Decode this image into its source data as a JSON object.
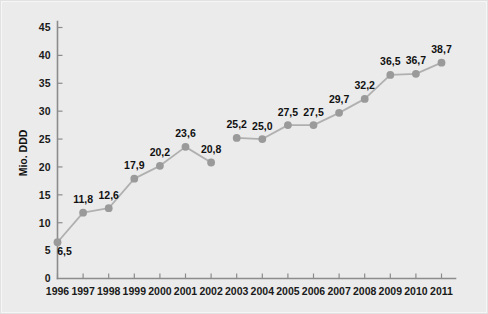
{
  "chart_data": {
    "type": "line",
    "title": "",
    "subtitle": "",
    "xlabel": "",
    "ylabel": "Mio. DDD",
    "categories": [
      "1996",
      "1997",
      "1998",
      "1999",
      "2000",
      "2001",
      "2002",
      "2003",
      "2004",
      "2005",
      "2006",
      "2007",
      "2008",
      "2009",
      "2010",
      "2011"
    ],
    "values": [
      6.5,
      11.8,
      12.6,
      17.9,
      20.2,
      23.6,
      20.8,
      25.2,
      25.0,
      27.5,
      27.5,
      29.7,
      32.2,
      36.5,
      36.7,
      38.7
    ],
    "point_labels": [
      "6,5",
      "11,8",
      "12,6",
      "17,9",
      "20,2",
      "23,6",
      "20,8",
      "25,2",
      "25,0",
      "27,5",
      "27,5",
      "29,7",
      "32,2",
      "36,5",
      "36,7",
      "38,7"
    ],
    "ylim": [
      0,
      45
    ],
    "ytick_values": [
      0,
      5,
      10,
      15,
      20,
      25,
      30,
      35,
      40,
      45
    ],
    "ytick_labels": [
      "0",
      "5",
      "10",
      "15",
      "20",
      "25",
      "30",
      "35",
      "40",
      "45"
    ],
    "grid": false,
    "legend": null,
    "legend_position": "none",
    "series_break_after_index": 6,
    "colors": {
      "background": "#ebebeb",
      "line": "#b0b0b0",
      "marker": "#9a9a9a",
      "axis": "#8c8c8c",
      "text": "#111111"
    }
  },
  "figure": {
    "width": 488,
    "height": 314
  }
}
